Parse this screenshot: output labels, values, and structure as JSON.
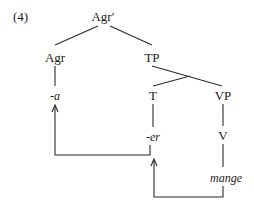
{
  "example_number": "(4)",
  "nodes": {
    "root": "Agr′",
    "agr": "Agr",
    "tp": "TP",
    "agr_head": "-a",
    "t": "T",
    "vp": "VP",
    "t_head": "-er",
    "v": "V",
    "verb": "mange"
  },
  "movements": [
    {
      "from": "mange",
      "to": "-er",
      "description": "V-to-T movement"
    },
    {
      "from": "-er",
      "to": "-a",
      "description": "T-to-Agr movement"
    }
  ],
  "colors": {
    "ink": "#1a1a1a",
    "background": "#ffffff"
  }
}
